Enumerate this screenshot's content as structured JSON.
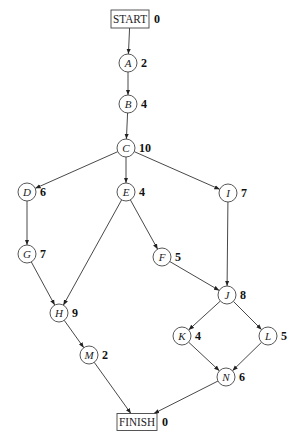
{
  "diagram": {
    "type": "activity-network",
    "nodes": [
      {
        "id": "START",
        "label": "START",
        "weight": "0",
        "shape": "box",
        "x": 130,
        "y": 19,
        "w": 38,
        "h": 18
      },
      {
        "id": "A",
        "label": "A",
        "weight": "2",
        "shape": "circle",
        "x": 128,
        "y": 63
      },
      {
        "id": "B",
        "label": "B",
        "weight": "4",
        "shape": "circle",
        "x": 128,
        "y": 104
      },
      {
        "id": "C",
        "label": "C",
        "weight": "10",
        "shape": "circle",
        "x": 126,
        "y": 148
      },
      {
        "id": "D",
        "label": "D",
        "weight": "6",
        "shape": "circle",
        "x": 27,
        "y": 192
      },
      {
        "id": "E",
        "label": "E",
        "weight": "4",
        "shape": "circle",
        "x": 126,
        "y": 192
      },
      {
        "id": "I",
        "label": "I",
        "weight": "7",
        "shape": "circle",
        "x": 228,
        "y": 193
      },
      {
        "id": "G",
        "label": "G",
        "weight": "7",
        "shape": "circle",
        "x": 27,
        "y": 254
      },
      {
        "id": "F",
        "label": "F",
        "weight": "5",
        "shape": "circle",
        "x": 162,
        "y": 257
      },
      {
        "id": "H",
        "label": "H",
        "weight": "9",
        "shape": "circle",
        "x": 59,
        "y": 313
      },
      {
        "id": "J",
        "label": "J",
        "weight": "8",
        "shape": "circle",
        "x": 227,
        "y": 295
      },
      {
        "id": "K",
        "label": "K",
        "weight": "4",
        "shape": "circle",
        "x": 182,
        "y": 336
      },
      {
        "id": "L",
        "label": "L",
        "weight": "5",
        "shape": "circle",
        "x": 268,
        "y": 336
      },
      {
        "id": "M",
        "label": "M",
        "weight": "2",
        "shape": "circle",
        "x": 89,
        "y": 355
      },
      {
        "id": "N",
        "label": "N",
        "weight": "6",
        "shape": "circle",
        "x": 226,
        "y": 377
      },
      {
        "id": "FINISH",
        "label": "FINISH",
        "weight": "0",
        "shape": "box",
        "x": 137,
        "y": 422,
        "w": 40,
        "h": 17
      }
    ],
    "edges": [
      [
        "START",
        "A"
      ],
      [
        "A",
        "B"
      ],
      [
        "B",
        "C"
      ],
      [
        "C",
        "D"
      ],
      [
        "C",
        "E"
      ],
      [
        "C",
        "I"
      ],
      [
        "D",
        "G"
      ],
      [
        "G",
        "H"
      ],
      [
        "E",
        "H"
      ],
      [
        "E",
        "F"
      ],
      [
        "F",
        "J"
      ],
      [
        "I",
        "J"
      ],
      [
        "H",
        "M"
      ],
      [
        "M",
        "FINISH"
      ],
      [
        "J",
        "K"
      ],
      [
        "J",
        "L"
      ],
      [
        "K",
        "N"
      ],
      [
        "L",
        "N"
      ],
      [
        "N",
        "FINISH"
      ]
    ],
    "node_radius": 9,
    "colors": {
      "stroke": "#444444",
      "text": "#222222",
      "background": "#ffffff"
    }
  }
}
